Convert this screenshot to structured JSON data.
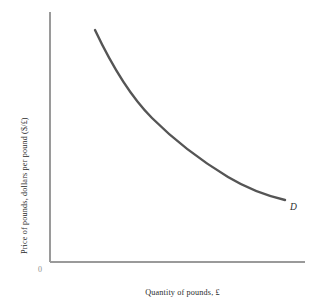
{
  "figure": {
    "background_color": "#ffffff",
    "width": 319,
    "height": 306
  },
  "axes": {
    "origin_label": "0",
    "axis_color": "#9a9a9a",
    "y_axis": {
      "label": "Price of pounds, dollars per pound ($/£)",
      "x_px": 50,
      "top_px": 12,
      "bottom_px": 262
    },
    "x_axis": {
      "label": "Quantity of pounds, £",
      "y_px": 262,
      "left_px": 50,
      "right_px": 305
    }
  },
  "curve": {
    "name": "demand-curve",
    "label": "D",
    "color": "#555555",
    "width_px": 2.4
  },
  "chart_data": {
    "type": "line",
    "title": "",
    "xlabel": "Quantity of pounds, £",
    "ylabel": "Price of pounds, dollars per pound ($/£)",
    "grid": false,
    "legend_position": "inline-right-end",
    "axis_ticks": {
      "x": [],
      "y": []
    },
    "origin_label": "0",
    "xlim": [
      0,
      100
    ],
    "ylim": [
      0,
      100
    ],
    "series": [
      {
        "name": "D",
        "annotation": "D",
        "description": "Downward-sloping, convex-to-origin demand curve for pounds",
        "x": [
          18,
          24,
          31,
          38,
          45,
          52,
          59,
          66,
          73,
          80,
          87,
          92
        ],
        "y": [
          93,
          85,
          76,
          68,
          61,
          55,
          49,
          44,
          40,
          36,
          33,
          31
        ]
      }
    ]
  }
}
